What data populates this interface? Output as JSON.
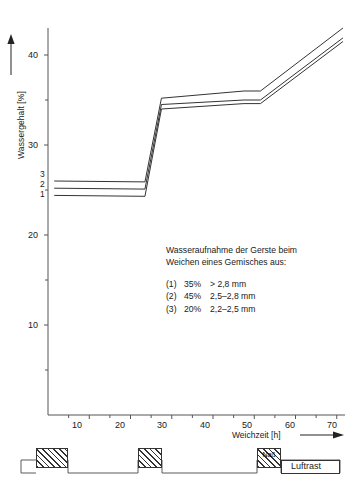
{
  "chart_data": {
    "type": "line",
    "title": "",
    "xlabel": "Weichzeit [h]",
    "ylabel": "Wassergehalt [%]",
    "xlim": [
      0,
      72
    ],
    "ylim": [
      0,
      45
    ],
    "xticks": [
      10,
      20,
      30,
      40,
      50,
      60,
      70
    ],
    "xminorticks": [
      5,
      15,
      25,
      35,
      45,
      55,
      65
    ],
    "yticks": [
      10,
      20,
      30,
      40
    ],
    "yminorticks": [
      5,
      15,
      25,
      35
    ],
    "grid": false,
    "legend_position": "inside-lower-right",
    "series": [
      {
        "name": "1",
        "label": "(1)  35%   > 2,8 mm",
        "x": [
          1.5,
          23.5,
          27.5,
          47.5,
          51.5,
          71.5
        ],
        "y": [
          24.4,
          24.3,
          34.0,
          34.6,
          34.6,
          41.5
        ]
      },
      {
        "name": "2",
        "label": "(2)  45%  2,5-2,8 mm",
        "x": [
          1.5,
          23.5,
          27.5,
          47.5,
          51.5,
          71.5
        ],
        "y": [
          25.2,
          25.1,
          34.5,
          35.0,
          35.0,
          41.9
        ]
      },
      {
        "name": "3",
        "label": "(3)  20%  2,2-2,5 mm",
        "x": [
          1.5,
          23.5,
          27.5,
          47.5,
          51.5,
          71.5
        ],
        "y": [
          26.0,
          25.9,
          35.2,
          36.0,
          36.0,
          43.0
        ]
      }
    ],
    "series_labels": [
      "3",
      "2",
      "1"
    ],
    "annotation": {
      "line1": "Wasseraufnahme der Gerste beim",
      "line2": "Weichen eines Gemisches aus:",
      "items": [
        {
          "num": "(1)",
          "pct": "35%",
          "range": "> 2,8 mm"
        },
        {
          "num": "(2)",
          "pct": "45%",
          "range": "2,5–2,8 mm"
        },
        {
          "num": "(3)",
          "pct": "20%",
          "range": "2,2–2,5 mm"
        }
      ]
    }
  },
  "axes": {
    "y_label_text": "Wassergehalt [%]",
    "x_label_text": "Weichzeit [h]",
    "y_tick_labels": [
      "40",
      "30",
      "20",
      "10"
    ],
    "x_tick_labels": [
      "10",
      "20",
      "30",
      "40",
      "50",
      "60",
      "70"
    ],
    "y_arrow_icon": "up-arrow-icon",
    "x_arrow_icon": "right-arrow-icon"
  },
  "timeline": {
    "wet_label": "Naß",
    "air_rest_label": "Luftrast",
    "segments": [
      {
        "kind": "wet",
        "tag": ""
      },
      {
        "kind": "dry",
        "tag": ""
      },
      {
        "kind": "wet",
        "tag": ""
      },
      {
        "kind": "dry",
        "tag": ""
      },
      {
        "kind": "wet",
        "tag": "Naß"
      },
      {
        "kind": "air",
        "tag": "Luftrast"
      }
    ]
  },
  "colors": {
    "line": "#333333",
    "axis": "#555555",
    "text": "#1a1a1a",
    "background": "#ffffff"
  }
}
